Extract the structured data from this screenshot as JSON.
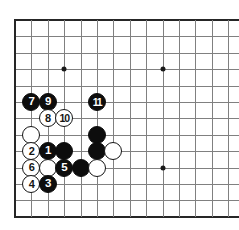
{
  "diagram": {
    "board_size": 19,
    "background_color": "#ffffff",
    "line_color": "#808080",
    "edge_color": "#262626",
    "black_stone_color": "#0d0d0d",
    "white_stone_color": "#ffffff",
    "geometry": {
      "origin_x": 15,
      "origin_y": 20,
      "spacing": 16.4,
      "cols_visible": 14,
      "rows_visible": 12,
      "stone_diameter": 18
    }
  },
  "star_points": [
    {
      "name": "star-point-upper-left",
      "col": 3,
      "row": 3
    },
    {
      "name": "star-point-upper-middle",
      "col": 9,
      "row": 3
    },
    {
      "name": "star-point-middle",
      "col": 9,
      "row": 9
    }
  ],
  "stones": [
    {
      "id": "stone-move-7",
      "color": "black",
      "label": "7",
      "col": 1,
      "row": 5
    },
    {
      "id": "stone-move-9",
      "color": "black",
      "label": "9",
      "col": 2,
      "row": 5
    },
    {
      "id": "stone-move-11",
      "color": "black",
      "label": "11",
      "col": 5,
      "row": 5
    },
    {
      "id": "stone-move-8",
      "color": "white",
      "label": "8",
      "col": 2,
      "row": 6
    },
    {
      "id": "stone-move-10",
      "color": "white",
      "label": "10",
      "col": 3,
      "row": 6
    },
    {
      "id": "stone-white-a",
      "color": "white",
      "label": "",
      "col": 1,
      "row": 7
    },
    {
      "id": "stone-black-a",
      "color": "black",
      "label": "",
      "col": 5,
      "row": 7
    },
    {
      "id": "stone-move-2",
      "color": "white",
      "label": "2",
      "col": 1,
      "row": 8
    },
    {
      "id": "stone-move-1",
      "color": "black",
      "label": "1",
      "col": 2,
      "row": 8
    },
    {
      "id": "stone-black-b",
      "color": "black",
      "label": "",
      "col": 3,
      "row": 8
    },
    {
      "id": "stone-black-c",
      "color": "black",
      "label": "",
      "col": 5,
      "row": 8
    },
    {
      "id": "stone-white-b",
      "color": "white",
      "label": "",
      "col": 6,
      "row": 8
    },
    {
      "id": "stone-move-6",
      "color": "white",
      "label": "6",
      "col": 1,
      "row": 9
    },
    {
      "id": "stone-white-c",
      "color": "white",
      "label": "",
      "col": 2,
      "row": 9
    },
    {
      "id": "stone-move-5",
      "color": "black",
      "label": "5",
      "col": 3,
      "row": 9
    },
    {
      "id": "stone-black-d",
      "color": "black",
      "label": "",
      "col": 4,
      "row": 9
    },
    {
      "id": "stone-white-d",
      "color": "white",
      "label": "",
      "col": 5,
      "row": 9
    },
    {
      "id": "stone-move-4",
      "color": "white",
      "label": "4",
      "col": 1,
      "row": 10
    },
    {
      "id": "stone-move-3",
      "color": "black",
      "label": "3",
      "col": 2,
      "row": 10
    }
  ]
}
